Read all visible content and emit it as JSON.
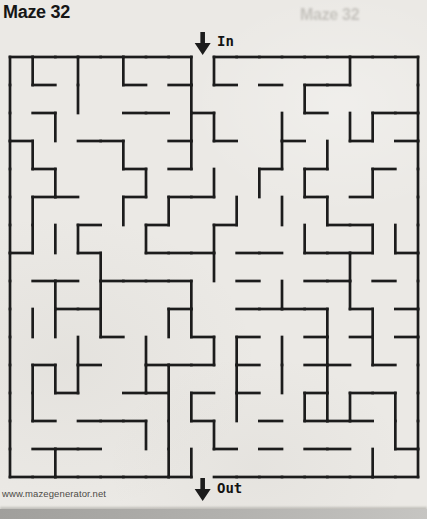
{
  "page": {
    "title": "Maze 32",
    "ghost_title": "Maze 32",
    "entry_label": "In",
    "exit_label": "Out",
    "footer_url": "www.mazegenerator.net"
  },
  "colors": {
    "paper": "#ebe9e5",
    "ink": "#1c1c1c",
    "ghost_text": "#8c8981",
    "footer_text": "#4d4b47",
    "scan_edge": "#a09f9c"
  },
  "maze": {
    "cols": 18,
    "rows": 15,
    "origin_x": 10,
    "origin_y": 57,
    "cell_w": 22.667,
    "cell_h": 28,
    "wall_width": 2.7,
    "entry_col": 8,
    "exit_col": 8,
    "v_walls": [
      [
        0,
        1,
        3,
        5,
        8,
        9,
        15,
        18
      ],
      [
        0,
        3,
        8,
        13,
        18
      ],
      [
        0,
        2,
        8,
        9,
        12,
        15,
        16,
        18
      ],
      [
        0,
        1,
        5,
        8,
        12,
        14,
        18
      ],
      [
        0,
        2,
        6,
        9,
        11,
        13,
        16,
        18
      ],
      [
        0,
        1,
        5,
        7,
        10,
        12,
        14,
        18
      ],
      [
        0,
        1,
        2,
        3,
        6,
        9,
        13,
        16,
        17,
        18
      ],
      [
        0,
        4,
        9,
        15,
        18
      ],
      [
        0,
        2,
        4,
        8,
        12,
        15,
        18
      ],
      [
        0,
        1,
        2,
        4,
        7,
        8,
        14,
        16,
        18
      ],
      [
        0,
        3,
        6,
        9,
        10,
        12,
        14,
        16,
        18
      ],
      [
        0,
        1,
        2,
        3,
        6,
        7,
        10,
        12,
        14,
        18
      ],
      [
        0,
        1,
        7,
        8,
        10,
        13,
        14,
        15,
        17,
        18
      ],
      [
        0,
        6,
        7,
        9,
        17,
        18
      ],
      [
        0,
        2,
        7,
        8,
        16,
        18
      ]
    ],
    "h_walls": [
      [
        0,
        1,
        2,
        3,
        4,
        5,
        6,
        7,
        9,
        10,
        11,
        12,
        13,
        14,
        15,
        16,
        17
      ],
      [
        1,
        5,
        7,
        9,
        11,
        13,
        14
      ],
      [
        1,
        5,
        6,
        8,
        13,
        16,
        17
      ],
      [
        0,
        3,
        4,
        7,
        9,
        12,
        15,
        17
      ],
      [
        1,
        5,
        7,
        11,
        13,
        16
      ],
      [
        1,
        2,
        5,
        7,
        8,
        13,
        15
      ],
      [
        3,
        6,
        9,
        14,
        15
      ],
      [
        0,
        3,
        6,
        7,
        8,
        10,
        11,
        13,
        14,
        15,
        17
      ],
      [
        1,
        2,
        4,
        5,
        6,
        7,
        10,
        13,
        14,
        16
      ],
      [
        2,
        3,
        7,
        10,
        11,
        12,
        13,
        15,
        17
      ],
      [
        4,
        8,
        10,
        13,
        15,
        17
      ],
      [
        1,
        3,
        6,
        7,
        8,
        10,
        13,
        14,
        16
      ],
      [
        2,
        5,
        6,
        8,
        10,
        13,
        15,
        16
      ],
      [
        1,
        3,
        4,
        5,
        8,
        11,
        13,
        14,
        15
      ],
      [
        1,
        2,
        3,
        9,
        11,
        13,
        14,
        17
      ],
      [
        0,
        1,
        2,
        3,
        4,
        5,
        6,
        7,
        9,
        10,
        11,
        12,
        13,
        14,
        15,
        16,
        17
      ]
    ]
  }
}
